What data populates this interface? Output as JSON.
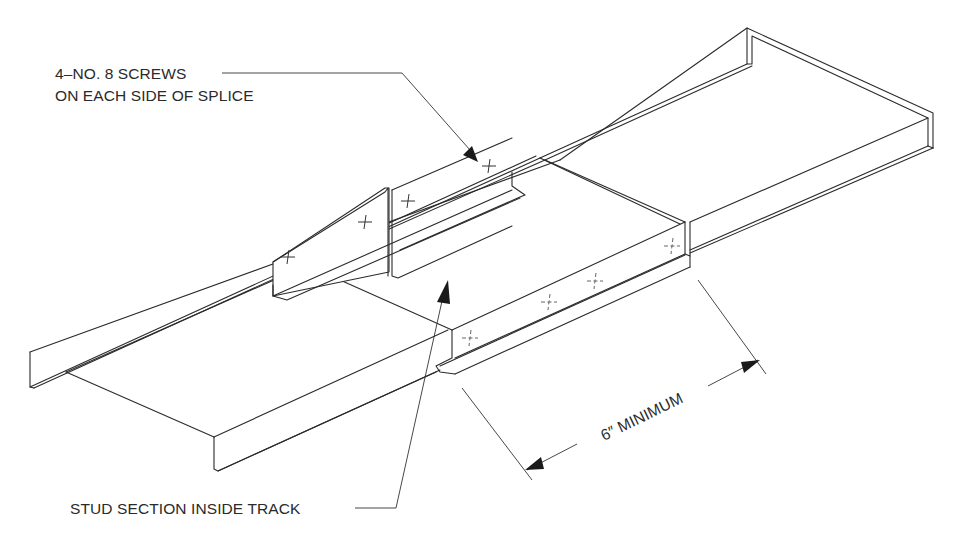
{
  "diagram": {
    "type": "isometric construction detail",
    "colors": {
      "background": "#ffffff",
      "linework": "#2b2b2b",
      "text": "#2a2a2a"
    },
    "labels": {
      "screws_line1": "4–NO. 8 SCREWS",
      "screws_line2": "ON EACH SIDE OF SPLICE",
      "stud_section": "STUD SECTION INSIDE TRACK",
      "dimension": "6″ MINIMUM"
    },
    "components": [
      {
        "name": "left-track-section",
        "description": "Left steel track (U-channel) segment"
      },
      {
        "name": "right-track-section",
        "description": "Right steel track (U-channel) segment"
      },
      {
        "name": "stud-section",
        "description": "Stud section nested inside track across the splice"
      },
      {
        "name": "screws",
        "description": "No. 8 screws, 4 on each side of splice",
        "count_per_side": 4
      }
    ],
    "dimension": {
      "value": "6″",
      "qualifier": "MINIMUM"
    }
  }
}
